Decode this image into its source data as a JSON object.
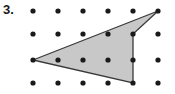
{
  "label": {
    "number": "3."
  },
  "figure": {
    "name": "geoboard-dot-grid-polygon",
    "colors": {
      "dot": "#1a1a1a",
      "fill": "#c8c8c8",
      "stroke": "#3a3a3a",
      "background": "#ffffff"
    },
    "grid": {
      "columns": 6,
      "rows": 4,
      "origin_x": 33,
      "origin_y": 11,
      "spacing_x": 25,
      "spacing_y": 24,
      "row_y": [
        11,
        34,
        60,
        83
      ],
      "col_x": [
        33,
        58,
        83,
        108,
        133,
        158
      ],
      "dot_radius": 2.6
    },
    "polygon": {
      "shape": "quadrilateral",
      "vertices": [
        {
          "name": "left-vertex",
          "col": 0,
          "row": 2,
          "x": 33,
          "y": 60
        },
        {
          "name": "top-right-vertex",
          "col": 5,
          "row": 0,
          "x": 158,
          "y": 11
        },
        {
          "name": "inner-notch-vertex",
          "col": 4,
          "row": 1,
          "x": 133,
          "y": 34
        },
        {
          "name": "bottom-vertex",
          "col": 4,
          "row": 3,
          "x": 133,
          "y": 83
        }
      ],
      "points": "33,60 158,11 133,34 133,83",
      "stroke_width": 1.3
    }
  }
}
